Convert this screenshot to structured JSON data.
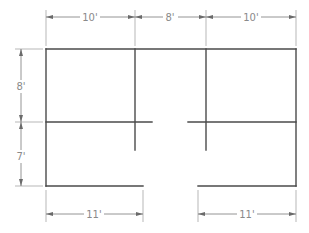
{
  "drawing": {
    "type": "floor-plan-dimensioned",
    "colors": {
      "wall": "#4a4a4a",
      "dimension": "#7a7a7a",
      "label": "#8a8a8a",
      "background": "#ffffff"
    },
    "top_dimensions": [
      {
        "label": "10'",
        "x1": 46,
        "x2": 135
      },
      {
        "label": "8'",
        "x1": 135,
        "x2": 206
      },
      {
        "label": "10'",
        "x1": 206,
        "x2": 296
      }
    ],
    "left_dimensions": [
      {
        "label": "8'",
        "y1": 49,
        "y2": 122
      },
      {
        "label": "7'",
        "y1": 122,
        "y2": 186
      }
    ],
    "bottom_dimensions": [
      {
        "label": "11'",
        "x1": 46,
        "x2": 143
      },
      {
        "label": "11'",
        "x1": 198,
        "x2": 296
      }
    ]
  }
}
